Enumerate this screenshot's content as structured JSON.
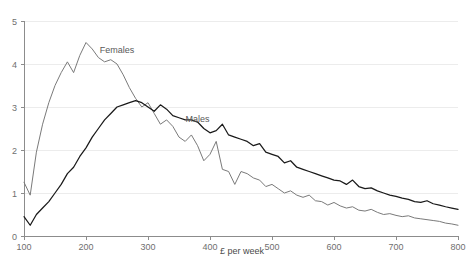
{
  "chart_data": {
    "type": "line",
    "title": "",
    "subtitle": "",
    "xlabel": "£ per week",
    "ylabel": "",
    "xlim": [
      100,
      800
    ],
    "ylim": [
      0,
      5
    ],
    "xticks": [
      100,
      200,
      300,
      400,
      500,
      600,
      700,
      800
    ],
    "yticks": [
      0,
      1,
      2,
      3,
      4,
      5
    ],
    "xtick_labels": [
      "100",
      "200",
      "300",
      "400",
      "500",
      "600",
      "700",
      "800"
    ],
    "ytick_labels": [
      "0",
      "1",
      "2",
      "3",
      "4",
      "5"
    ],
    "grid": "horizontal",
    "legend_position": "inline-annotation",
    "series": [
      {
        "name": "Females",
        "color": "#7a7a7a",
        "label_x": 250,
        "label_y": 4.25,
        "x": [
          100,
          110,
          120,
          130,
          140,
          150,
          160,
          170,
          180,
          190,
          200,
          210,
          220,
          230,
          240,
          250,
          260,
          270,
          280,
          290,
          300,
          310,
          320,
          330,
          340,
          350,
          360,
          370,
          380,
          390,
          400,
          410,
          420,
          430,
          440,
          450,
          460,
          470,
          480,
          490,
          500,
          510,
          520,
          530,
          540,
          550,
          560,
          570,
          580,
          590,
          600,
          610,
          620,
          630,
          640,
          650,
          660,
          670,
          680,
          690,
          700,
          710,
          720,
          730,
          740,
          750,
          760,
          770,
          780,
          790,
          800
        ],
        "y": [
          1.25,
          0.95,
          1.95,
          2.6,
          3.1,
          3.5,
          3.8,
          4.05,
          3.8,
          4.2,
          4.5,
          4.35,
          4.15,
          4.05,
          4.1,
          4.0,
          3.75,
          3.45,
          3.2,
          3.0,
          3.1,
          2.85,
          2.6,
          2.7,
          2.55,
          2.3,
          2.2,
          2.35,
          2.1,
          1.75,
          1.9,
          2.2,
          1.55,
          1.5,
          1.2,
          1.5,
          1.45,
          1.35,
          1.3,
          1.15,
          1.2,
          1.1,
          1.0,
          1.05,
          0.95,
          0.9,
          0.95,
          0.82,
          0.8,
          0.72,
          0.78,
          0.7,
          0.65,
          0.68,
          0.6,
          0.58,
          0.62,
          0.55,
          0.5,
          0.52,
          0.48,
          0.45,
          0.47,
          0.42,
          0.4,
          0.38,
          0.36,
          0.34,
          0.3,
          0.28,
          0.25
        ]
      },
      {
        "name": "Males",
        "color": "#1a1a1a",
        "label_x": 380,
        "label_y": 2.65,
        "x": [
          100,
          110,
          120,
          130,
          140,
          150,
          160,
          170,
          180,
          190,
          200,
          210,
          220,
          230,
          240,
          250,
          260,
          270,
          280,
          290,
          300,
          310,
          320,
          330,
          340,
          350,
          360,
          370,
          380,
          390,
          400,
          410,
          420,
          430,
          440,
          450,
          460,
          470,
          480,
          490,
          500,
          510,
          520,
          530,
          540,
          550,
          560,
          570,
          580,
          590,
          600,
          610,
          620,
          630,
          640,
          650,
          660,
          670,
          680,
          690,
          700,
          710,
          720,
          730,
          740,
          750,
          760,
          770,
          780,
          790,
          800
        ],
        "y": [
          0.45,
          0.25,
          0.5,
          0.65,
          0.8,
          1.0,
          1.2,
          1.45,
          1.6,
          1.85,
          2.05,
          2.3,
          2.5,
          2.7,
          2.85,
          3.0,
          3.05,
          3.1,
          3.15,
          3.1,
          3.0,
          2.9,
          3.05,
          2.95,
          2.8,
          2.75,
          2.7,
          2.7,
          2.65,
          2.5,
          2.4,
          2.45,
          2.6,
          2.35,
          2.3,
          2.25,
          2.2,
          2.1,
          2.15,
          1.95,
          1.9,
          1.85,
          1.7,
          1.75,
          1.6,
          1.55,
          1.5,
          1.45,
          1.4,
          1.35,
          1.3,
          1.28,
          1.2,
          1.3,
          1.15,
          1.1,
          1.12,
          1.05,
          1.0,
          0.95,
          0.92,
          0.88,
          0.85,
          0.8,
          0.78,
          0.82,
          0.75,
          0.72,
          0.68,
          0.65,
          0.62
        ]
      }
    ]
  },
  "axes": {
    "x_axis_title": "£ per week"
  },
  "labels": {
    "females": "Females",
    "males": "Males"
  }
}
